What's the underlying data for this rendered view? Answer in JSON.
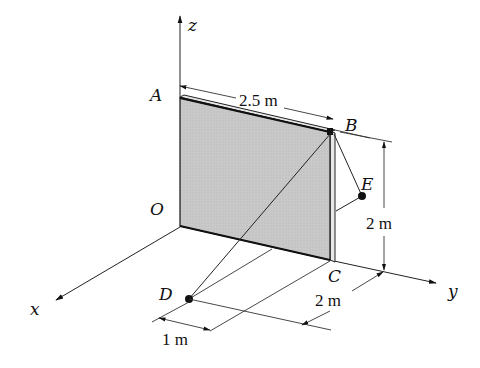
{
  "diagram": {
    "type": "3D statics figure - rectangular plate with cables",
    "axes": {
      "x_label": "x",
      "y_label": "y",
      "z_label": "z"
    },
    "points": {
      "A": "A",
      "B": "B",
      "C": "C",
      "D": "D",
      "E": "E",
      "O": "O"
    },
    "dimensions": {
      "plate_width": "2.5 m",
      "plate_height": "2 m",
      "d_offset_y": "2 m",
      "d_offset_x": "1 m"
    },
    "colors": {
      "plate_fill": "#c8c8c8",
      "line": "#222222"
    }
  }
}
